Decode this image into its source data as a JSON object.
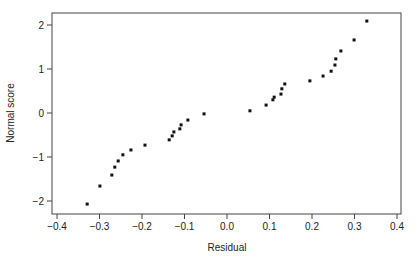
{
  "chart_data": {
    "type": "scatter",
    "title": "",
    "xlabel": "Residual",
    "ylabel": "Normal score",
    "xlim": [
      -0.41,
      0.41
    ],
    "ylim": [
      -2.3,
      2.3
    ],
    "xticks": [
      -0.4,
      -0.3,
      -0.2,
      -0.1,
      0.0,
      0.1,
      0.2,
      0.3,
      0.4
    ],
    "xtick_labels": [
      "-0.4",
      "-0.3",
      "-0.2",
      "-0.1",
      "0.0",
      "0.1",
      "0.2",
      "0.3",
      "0.4"
    ],
    "yticks": [
      -2,
      -1,
      0,
      1,
      2
    ],
    "ytick_labels": [
      "-2",
      "-1",
      "0",
      "1",
      "2"
    ],
    "grid": false,
    "legend": null,
    "points": [
      {
        "x": -0.329,
        "y": -2.07
      },
      {
        "x": -0.299,
        "y": -1.66
      },
      {
        "x": -0.271,
        "y": -1.41
      },
      {
        "x": -0.264,
        "y": -1.23
      },
      {
        "x": -0.256,
        "y": -1.09
      },
      {
        "x": -0.245,
        "y": -0.95
      },
      {
        "x": -0.226,
        "y": -0.84
      },
      {
        "x": -0.193,
        "y": -0.73
      },
      {
        "x": -0.136,
        "y": -0.61
      },
      {
        "x": -0.129,
        "y": -0.52
      },
      {
        "x": -0.125,
        "y": -0.43
      },
      {
        "x": -0.111,
        "y": -0.36
      },
      {
        "x": -0.108,
        "y": -0.27
      },
      {
        "x": -0.092,
        "y": -0.16
      },
      {
        "x": -0.054,
        "y": -0.02
      },
      {
        "x": 0.054,
        "y": 0.05
      },
      {
        "x": 0.092,
        "y": 0.18
      },
      {
        "x": 0.108,
        "y": 0.3
      },
      {
        "x": 0.111,
        "y": 0.36
      },
      {
        "x": 0.127,
        "y": 0.43
      },
      {
        "x": 0.129,
        "y": 0.55
      },
      {
        "x": 0.136,
        "y": 0.66
      },
      {
        "x": 0.195,
        "y": 0.73
      },
      {
        "x": 0.226,
        "y": 0.84
      },
      {
        "x": 0.245,
        "y": 0.95
      },
      {
        "x": 0.254,
        "y": 1.09
      },
      {
        "x": 0.256,
        "y": 1.23
      },
      {
        "x": 0.268,
        "y": 1.41
      },
      {
        "x": 0.299,
        "y": 1.66
      },
      {
        "x": 0.329,
        "y": 2.09
      }
    ]
  }
}
